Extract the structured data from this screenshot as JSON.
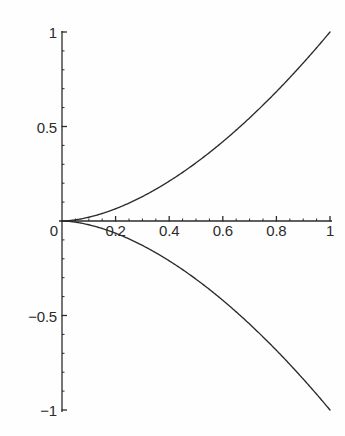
{
  "chart_data": {
    "type": "line",
    "title": "",
    "subtitle": "",
    "xlabel": "",
    "ylabel": "",
    "xlim": [
      0,
      1
    ],
    "ylim": [
      -1,
      1
    ],
    "grid": false,
    "legend": null,
    "legend_position": "none",
    "background_color": "#fefefe",
    "axis_color": "#2b2b2b",
    "curve_color": "#2b2b2b",
    "axes_style": "crossed-axes-at-origin",
    "x_ticks_major": [
      0.2,
      0.4,
      0.6,
      0.8,
      1
    ],
    "x_tick_labels": [
      "0.2",
      "0.4",
      "0.6",
      "0.8",
      "1"
    ],
    "x_ticks_minor": [
      0.05,
      0.1,
      0.15,
      0.25,
      0.3,
      0.35,
      0.45,
      0.5,
      0.55,
      0.65,
      0.7,
      0.75,
      0.85,
      0.9,
      0.95
    ],
    "y_ticks_major": [
      -1,
      -0.5,
      0.5,
      1
    ],
    "y_tick_labels": [
      "-1",
      "-0.5",
      "0.5",
      "1"
    ],
    "y_ticks_minor": [
      -0.9,
      -0.8,
      -0.7,
      -0.6,
      -0.4,
      -0.3,
      -0.2,
      -0.1,
      0.1,
      0.2,
      0.3,
      0.4,
      0.6,
      0.7,
      0.8,
      0.9
    ],
    "origin_label": "0",
    "series": [
      {
        "name": "upper-branch",
        "formula": "y = x^1.7",
        "x": [
          0,
          0.05,
          0.1,
          0.15,
          0.2,
          0.25,
          0.3,
          0.35,
          0.4,
          0.45,
          0.5,
          0.55,
          0.6,
          0.65,
          0.7,
          0.75,
          0.8,
          0.85,
          0.9,
          0.95,
          1
        ],
        "values": [
          0,
          0.0063,
          0.02,
          0.039,
          0.0631,
          0.092,
          0.1254,
          0.1632,
          0.2053,
          0.2516,
          0.3078,
          0.3565,
          0.4143,
          0.4758,
          0.5413,
          0.6103,
          0.683,
          0.7591,
          0.8386,
          0.9213,
          1
        ]
      },
      {
        "name": "lower-branch",
        "formula": "y = -x^1.7",
        "x": [
          0,
          0.05,
          0.1,
          0.15,
          0.2,
          0.25,
          0.3,
          0.35,
          0.4,
          0.45,
          0.5,
          0.55,
          0.6,
          0.65,
          0.7,
          0.75,
          0.8,
          0.85,
          0.9,
          0.95,
          1
        ],
        "values": [
          0,
          -0.0063,
          -0.02,
          -0.039,
          -0.0631,
          -0.092,
          -0.1254,
          -0.1632,
          -0.2053,
          -0.2516,
          -0.3078,
          -0.3565,
          -0.4143,
          -0.4758,
          -0.5413,
          -0.6103,
          -0.683,
          -0.7591,
          -0.8386,
          -0.9213,
          -1
        ]
      }
    ]
  },
  "geometry": {
    "origin_x_px": 62,
    "origin_y_px": 221,
    "x_right_px": 330,
    "y_top_px": 32,
    "y_bottom_px": 410
  }
}
